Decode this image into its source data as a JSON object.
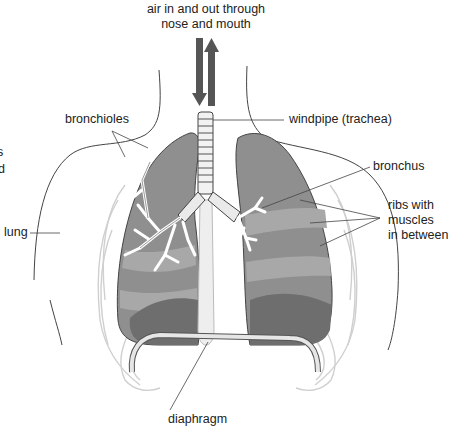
{
  "diagram": {
    "labels": {
      "airflow": [
        "air in and out through",
        "nose and mouth"
      ],
      "windpipe": "windpipe (trachea)",
      "bronchioles": "bronchioles",
      "bronchus": "bronchus",
      "ribs": [
        "ribs with",
        "muscles",
        "in between"
      ],
      "lung": "lung",
      "diaphragm": "diaphragm"
    },
    "edge_fragments": [
      "s",
      "d"
    ],
    "colors": {
      "lung_fill": "#8f8f8f",
      "lung_light": "#b5b5b5",
      "lung_dark": "#6e6e6e",
      "arrow": "#555555",
      "outline": "#444444",
      "rib": "#d8d8d8",
      "airway": "#f2f2f2"
    }
  }
}
